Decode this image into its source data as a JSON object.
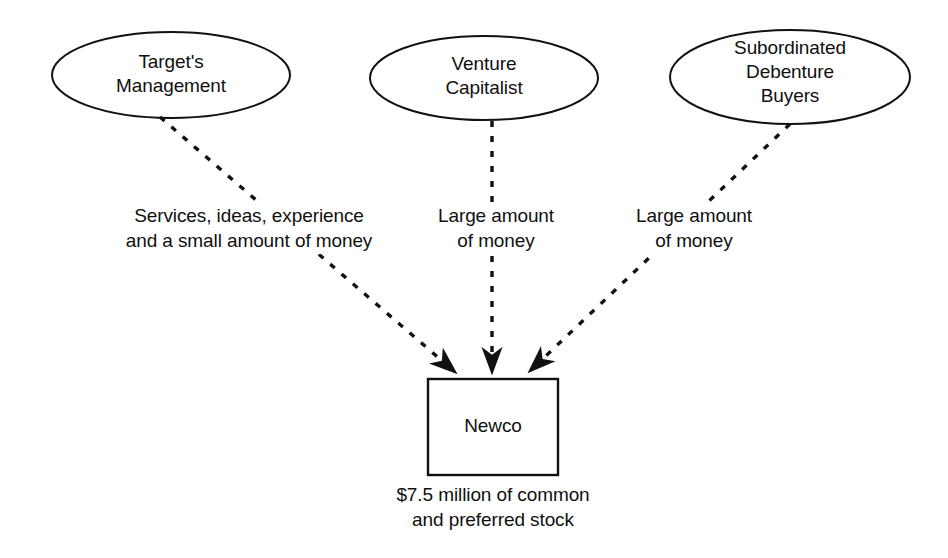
{
  "diagram": {
    "background_color": "#ffffff",
    "stroke_color": "#111111",
    "nodes": [
      {
        "id": "targets-management",
        "shape": "ellipse",
        "label": "Target's\nManagement"
      },
      {
        "id": "venture-capitalist",
        "shape": "ellipse",
        "label": "Venture\nCapitalist"
      },
      {
        "id": "subordinated-debenture-buyers",
        "shape": "ellipse",
        "label": "Subordinated\nDebenture\nBuyers"
      },
      {
        "id": "newco",
        "shape": "rectangle",
        "label": "Newco"
      }
    ],
    "edges": [
      {
        "id": "management-to-newco",
        "from": "targets-management",
        "to": "newco",
        "style": "dashed",
        "arrowhead": "filled",
        "label": "Services, ideas, experience\nand a small amount of money"
      },
      {
        "id": "vc-to-newco",
        "from": "venture-capitalist",
        "to": "newco",
        "style": "dashed",
        "arrowhead": "filled",
        "label": "Large amount\nof money"
      },
      {
        "id": "sub-to-newco",
        "from": "subordinated-debenture-buyers",
        "to": "newco",
        "style": "dashed",
        "arrowhead": "filled",
        "label": "Large amount\nof money"
      }
    ],
    "caption": "$7.5 million of common\nand preferred stock"
  }
}
